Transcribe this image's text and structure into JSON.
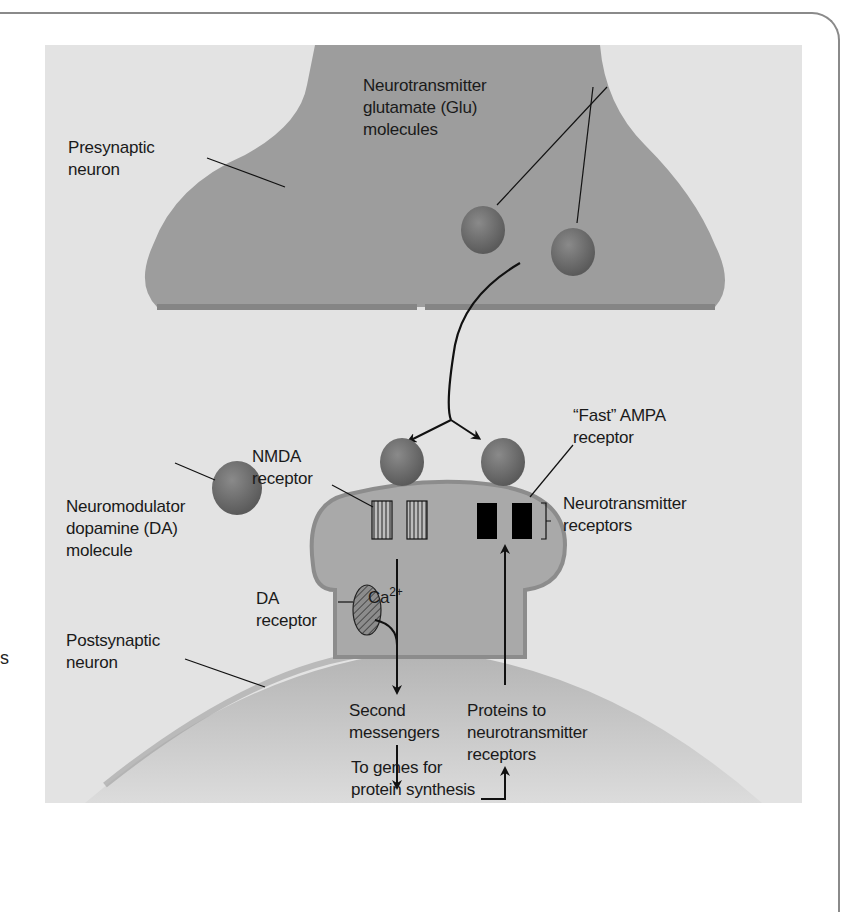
{
  "figure": {
    "type": "synapse-diagram",
    "colors": {
      "panel_bg": "#e3e3e3",
      "neuron_fill": "#9c9c9c",
      "neuron_edge": "#858585",
      "spine_fill": "#a8a8a8",
      "molecule_fill": "#6f6f6f",
      "receptor_ampa": "#000000",
      "frame": "#8a8a8a"
    },
    "labels": {
      "presynaptic": [
        "Presynaptic",
        "neuron"
      ],
      "glutamate": [
        "Neurotransmitter",
        "glutamate (Glu)",
        "molecules"
      ],
      "nmda": [
        "NMDA",
        "receptor"
      ],
      "ampa": [
        "“Fast” AMPA",
        "receptor"
      ],
      "nt_receptors": [
        "Neurotransmitter",
        "receptors"
      ],
      "dopamine": [
        "Neuromodulator",
        "dopamine (DA)",
        "molecule"
      ],
      "calcium_base": "Ca",
      "calcium_sup": "2+",
      "da_receptor": [
        "DA",
        "receptor"
      ],
      "postsynaptic": [
        "Postsynaptic",
        "neuron"
      ],
      "second_messengers": [
        "Second",
        "messengers"
      ],
      "proteins": [
        "Proteins to",
        "neurotransmitter",
        "receptors"
      ],
      "genes": [
        "To genes for",
        "protein synthesis"
      ]
    },
    "margin_fragment": "s"
  }
}
